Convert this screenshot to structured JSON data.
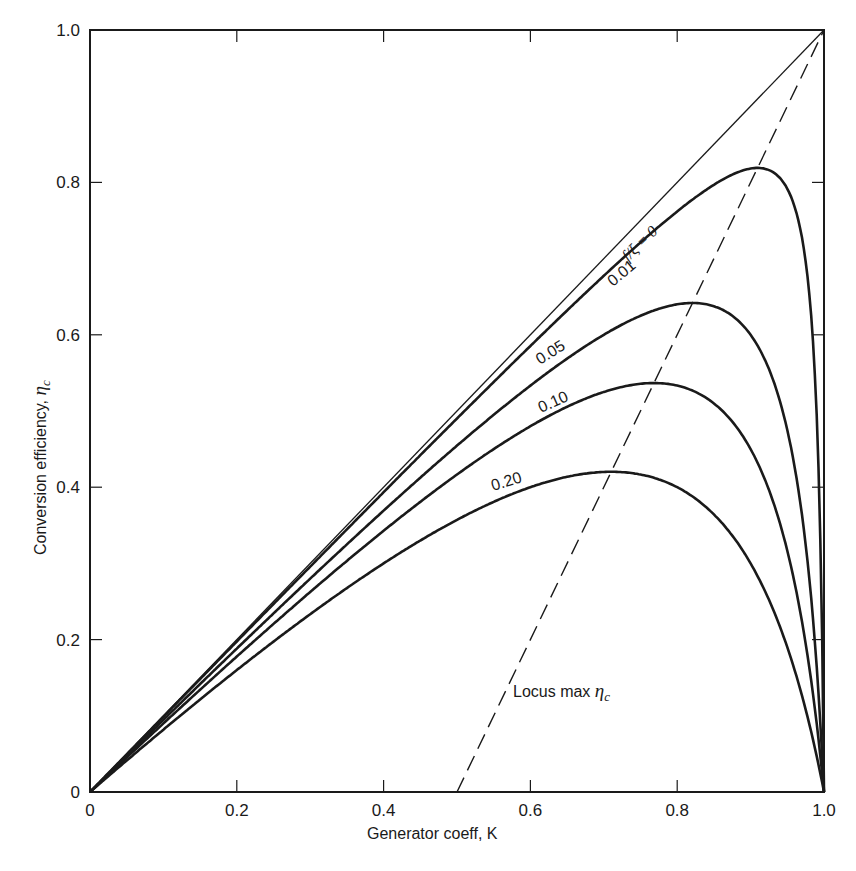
{
  "chart_data": {
    "type": "line",
    "title": "",
    "xlabel": "Generator coeff, K",
    "ylabel": "Conversion efficiency, ηc",
    "xlim": [
      0,
      1.0
    ],
    "ylim": [
      0,
      1.0
    ],
    "x_ticks": [
      "0",
      "0.2",
      "0.4",
      "0.6",
      "0.8",
      "1.0"
    ],
    "y_ticks": [
      "0",
      "0.2",
      "0.4",
      "0.6",
      "0.8",
      "1.0"
    ],
    "grid": false,
    "legend": "none (inline curve labels)",
    "parameter": "f/ξ",
    "series": [
      {
        "name": "f/ξ = 0",
        "label": "f/ξ = 0",
        "param": 0.0,
        "style": "thin",
        "x": [
          0,
          1.0
        ],
        "y": [
          0,
          1.0
        ]
      },
      {
        "name": "0.01",
        "label": "0.01",
        "param": 0.01,
        "style": "thick",
        "peak": {
          "x": 0.89,
          "y": 0.81
        }
      },
      {
        "name": "0.05",
        "label": "0.05",
        "param": 0.05,
        "style": "thick",
        "peak": {
          "x": 0.8,
          "y": 0.64
        }
      },
      {
        "name": "0.10",
        "label": "0.10",
        "param": 0.1,
        "style": "thick",
        "peak": {
          "x": 0.76,
          "y": 0.54
        }
      },
      {
        "name": "0.20",
        "label": "0.20",
        "param": 0.2,
        "style": "thick",
        "peak": {
          "x": 0.7,
          "y": 0.425
        }
      },
      {
        "name": "Locus max ηc",
        "label": "Locus max ηc",
        "style": "dashed",
        "x": [
          0.5,
          1.0
        ],
        "y": [
          0,
          1.0
        ]
      }
    ],
    "annotations": [
      {
        "text": "f/ξ = 0",
        "x": 0.74,
        "y": 0.75,
        "rotation": -45
      },
      {
        "text": "0.01",
        "x": 0.75,
        "y": 0.71,
        "rotation": -40
      },
      {
        "text": "0.05",
        "x": 0.6,
        "y": 0.56,
        "rotation": -33
      },
      {
        "text": "0.10",
        "x": 0.61,
        "y": 0.46,
        "rotation": -25
      },
      {
        "text": "0.20",
        "x": 0.54,
        "y": 0.36,
        "rotation": -18
      },
      {
        "text": "Locus max ηc",
        "x": 0.575,
        "y": 0.12,
        "rotation": 0
      }
    ]
  },
  "labels": {
    "xlabel": "Generator coeff,  K",
    "ylabel_text": "Conversion efficiency, ",
    "ylabel_symbol": "η",
    "ylabel_sub": "c",
    "locus_text": "Locus max ",
    "locus_symbol": "η",
    "locus_sub": "c",
    "f0_label": "f/ξ = 0",
    "c001": "0.01",
    "c005": "0.05",
    "c010": "0.10",
    "c020": "0.20"
  }
}
